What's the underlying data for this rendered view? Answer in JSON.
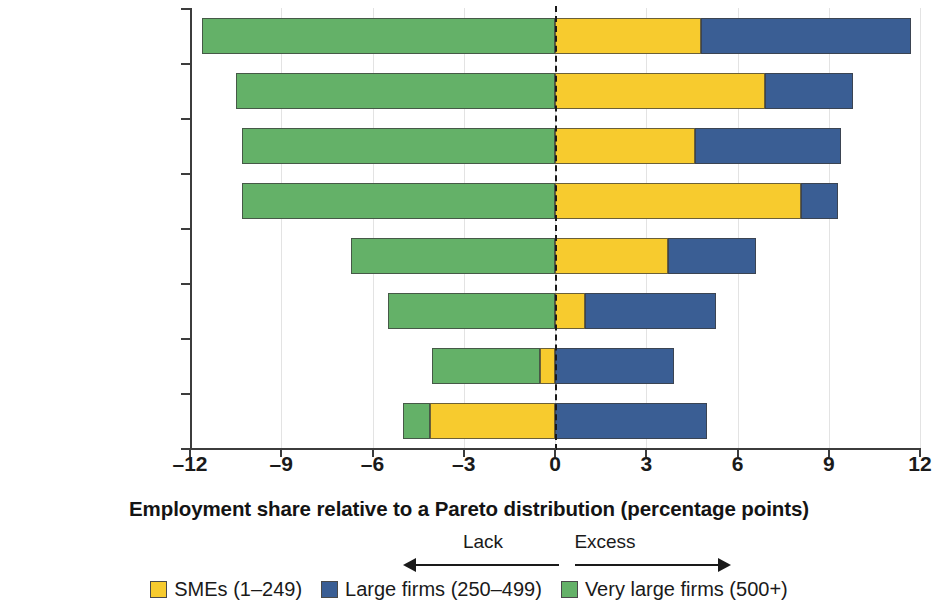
{
  "chart_data": {
    "type": "bar",
    "orientation": "horizontal",
    "stacked": true,
    "title": "",
    "xlabel": "Employment share relative to a Pareto distribution (percentage points)",
    "ylabel": "",
    "xlim": [
      -12,
      12
    ],
    "xticks": [
      -12,
      -9,
      -6,
      -3,
      0,
      3,
      6,
      9,
      12
    ],
    "xtick_labels": [
      "–12",
      "–9",
      "–6",
      "–3",
      "0",
      "3",
      "6",
      "9",
      "12"
    ],
    "grid": true,
    "reference_line": 0,
    "legend_position": "bottom",
    "categories": [
      "Kyrgyz Republic",
      "Bulgaria",
      "North Macedonia",
      "Kosovo",
      "Montenegro",
      "Croatia",
      "Romania",
      "Serbia"
    ],
    "series": [
      {
        "name": "SMEs (1–249)",
        "color": "#f7cb2e",
        "values": [
          4.8,
          6.9,
          4.6,
          8.1,
          3.7,
          1.0,
          -0.5,
          4.1
        ]
      },
      {
        "name": "Large firms (250–499)",
        "color": "#3a5e94",
        "values": [
          6.9,
          2.9,
          4.8,
          1.2,
          2.9,
          4.3,
          3.9,
          5.0
        ]
      },
      {
        "name": "Very large firms (500+)",
        "color": "#64b168",
        "values": [
          -11.6,
          -10.5,
          -10.3,
          -10.3,
          -6.7,
          -5.5,
          -3.6,
          -0.9
        ]
      }
    ],
    "bars": [
      {
        "category": "Kyrgyz Republic",
        "segments": [
          {
            "series": "Very large firms (500+)",
            "start": -11.6,
            "end": 0.0
          },
          {
            "series": "SMEs (1–249)",
            "start": 0.0,
            "end": 4.8
          },
          {
            "series": "Large firms (250–499)",
            "start": 4.8,
            "end": 11.7
          }
        ]
      },
      {
        "category": "Bulgaria",
        "segments": [
          {
            "series": "Very large firms (500+)",
            "start": -10.5,
            "end": 0.0
          },
          {
            "series": "SMEs (1–249)",
            "start": 0.0,
            "end": 6.9
          },
          {
            "series": "Large firms (250–499)",
            "start": 6.9,
            "end": 9.8
          }
        ]
      },
      {
        "category": "North Macedonia",
        "segments": [
          {
            "series": "Very large firms (500+)",
            "start": -10.3,
            "end": 0.0
          },
          {
            "series": "SMEs (1–249)",
            "start": 0.0,
            "end": 4.6
          },
          {
            "series": "Large firms (250–499)",
            "start": 4.6,
            "end": 9.4
          }
        ]
      },
      {
        "category": "Kosovo",
        "segments": [
          {
            "series": "Very large firms (500+)",
            "start": -10.3,
            "end": 0.0
          },
          {
            "series": "SMEs (1–249)",
            "start": 0.0,
            "end": 8.1
          },
          {
            "series": "Large firms (250–499)",
            "start": 8.1,
            "end": 9.3
          }
        ]
      },
      {
        "category": "Montenegro",
        "segments": [
          {
            "series": "Very large firms (500+)",
            "start": -6.7,
            "end": 0.0
          },
          {
            "series": "SMEs (1–249)",
            "start": 0.0,
            "end": 3.7
          },
          {
            "series": "Large firms (250–499)",
            "start": 3.7,
            "end": 6.6
          }
        ]
      },
      {
        "category": "Croatia",
        "segments": [
          {
            "series": "Very large firms (500+)",
            "start": -5.5,
            "end": 0.0
          },
          {
            "series": "SMEs (1–249)",
            "start": 0.0,
            "end": 1.0
          },
          {
            "series": "Large firms (250–499)",
            "start": 1.0,
            "end": 5.3
          }
        ]
      },
      {
        "category": "Romania",
        "segments": [
          {
            "series": "Very large firms (500+)",
            "start": -4.05,
            "end": -0.5
          },
          {
            "series": "SMEs (1–249)",
            "start": -0.5,
            "end": 0.0
          },
          {
            "series": "Large firms (250–499)",
            "start": 0.0,
            "end": 3.9
          }
        ]
      },
      {
        "category": "Serbia",
        "segments": [
          {
            "series": "Very large firms (500+)",
            "start": -5.0,
            "end": -4.1
          },
          {
            "series": "SMEs (1–249)",
            "start": -4.1,
            "end": 0.0
          },
          {
            "series": "Large firms (250–499)",
            "start": 0.0,
            "end": 5.0
          }
        ]
      }
    ]
  },
  "annotations": {
    "lack_label": "Lack",
    "excess_label": "Excess"
  },
  "legend": {
    "items": [
      {
        "label": "SMEs (1–249)",
        "color": "#f7cb2e"
      },
      {
        "label": "Large firms (250–499)",
        "color": "#3a5e94"
      },
      {
        "label": "Very large firms (500+)",
        "color": "#64b168"
      }
    ]
  }
}
